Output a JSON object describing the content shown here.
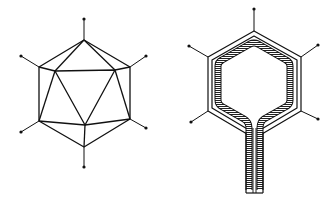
{
  "figure": {
    "panels": [
      {
        "id": "icosahedral-capsid",
        "description": "Icosahedral virus capsid with spikes at vertices",
        "outer_vertices": [
          [
            84,
            40
          ],
          [
            130,
            67
          ],
          [
            130,
            119
          ],
          [
            84,
            147
          ],
          [
            39,
            121
          ],
          [
            39,
            67
          ]
        ],
        "inner_vertices": [
          [
            55,
            71
          ],
          [
            115,
            70
          ],
          [
            85,
            125
          ]
        ],
        "spike_tips": [
          [
            84,
            19
          ],
          [
            146,
            56
          ],
          [
            146,
            128
          ],
          [
            84,
            167
          ],
          [
            21,
            132
          ],
          [
            21,
            56
          ]
        ]
      },
      {
        "id": "capsid-cross-section-with-tail",
        "description": "Cross-section of capsid showing layered shell and hatched nucleic acid/tail",
        "outer_vertices": [
          [
            254,
            31
          ],
          [
            301,
            57
          ],
          [
            301,
            111
          ],
          [
            262,
            134
          ],
          [
            247,
            134
          ],
          [
            208,
            111
          ],
          [
            208,
            57
          ]
        ],
        "spike_tips": [
          [
            254,
            9
          ],
          [
            318,
            45
          ],
          [
            318,
            119
          ],
          [
            191,
            122
          ],
          [
            189,
            46
          ]
        ],
        "tail": {
          "x": [
            247,
            262
          ],
          "y_top": 130,
          "y_bottom": 193
        }
      }
    ],
    "colors": {
      "line": "#111111",
      "background": "#ffffff"
    }
  }
}
